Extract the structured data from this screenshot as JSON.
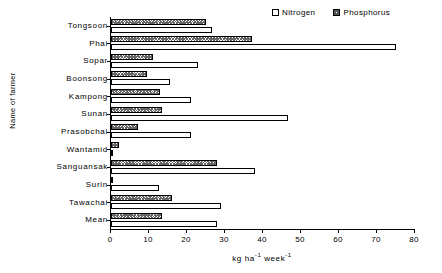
{
  "chart_data": {
    "type": "bar",
    "orientation": "horizontal",
    "title": "",
    "xlabel": "kg ha-1 week-1",
    "xlabel_parts": {
      "unit": "kg ha",
      "sup1": "-1",
      "per": " week",
      "sup2": "-1"
    },
    "ylabel": "Name of farmer",
    "xlim": [
      0,
      80
    ],
    "xticks": [
      0,
      10,
      20,
      30,
      40,
      50,
      60,
      70,
      80
    ],
    "grid": false,
    "legend_position": "top-right",
    "categories": [
      "Tongsoon",
      "Phai",
      "Sopar",
      "Boonsong",
      "Kampong",
      "Sunan",
      "Prasobchai",
      "Wantamid",
      "Sanguansak",
      "Surin",
      "Tawachai",
      "Mean"
    ],
    "series": [
      {
        "name": "Nitrogen",
        "color": "#ffffff",
        "pattern": "solid",
        "values": [
          26.5,
          75.0,
          23.0,
          15.5,
          21.0,
          46.5,
          21.0,
          0.5,
          38.0,
          12.5,
          29.0,
          28.0
        ]
      },
      {
        "name": "Phosphorus",
        "color": "#ffffff",
        "pattern": "crosshatch",
        "values": [
          25.0,
          37.0,
          11.0,
          9.5,
          13.0,
          13.5,
          7.0,
          2.0,
          28.0,
          0.5,
          16.0,
          13.5
        ]
      }
    ]
  },
  "legend": {
    "entries": [
      {
        "label": "Nitrogen",
        "swatch": "swatch-empty-icon"
      },
      {
        "label": "Phosphorus",
        "swatch": "swatch-hatched-icon"
      }
    ]
  }
}
